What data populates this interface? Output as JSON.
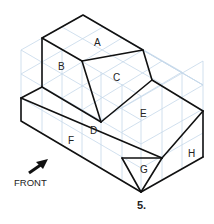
{
  "figure": {
    "number_label": "5.",
    "front_label": "FRONT",
    "colors": {
      "edge": "#111111",
      "grid": "#c5d8ea",
      "text": "#222222",
      "background": "#ffffff"
    }
  },
  "faces": [
    {
      "id": "A",
      "label": "A",
      "x": 98,
      "y": 44
    },
    {
      "id": "B",
      "label": "B",
      "x": 62,
      "y": 70
    },
    {
      "id": "C",
      "label": "C",
      "x": 117,
      "y": 81
    },
    {
      "id": "D",
      "label": "D",
      "x": 94,
      "y": 134
    },
    {
      "id": "E",
      "label": "E",
      "x": 144,
      "y": 117
    },
    {
      "id": "F",
      "label": "F",
      "x": 72,
      "y": 144
    },
    {
      "id": "G",
      "label": "G",
      "x": 144,
      "y": 173
    },
    {
      "id": "H",
      "label": "H",
      "x": 192,
      "y": 155
    }
  ]
}
